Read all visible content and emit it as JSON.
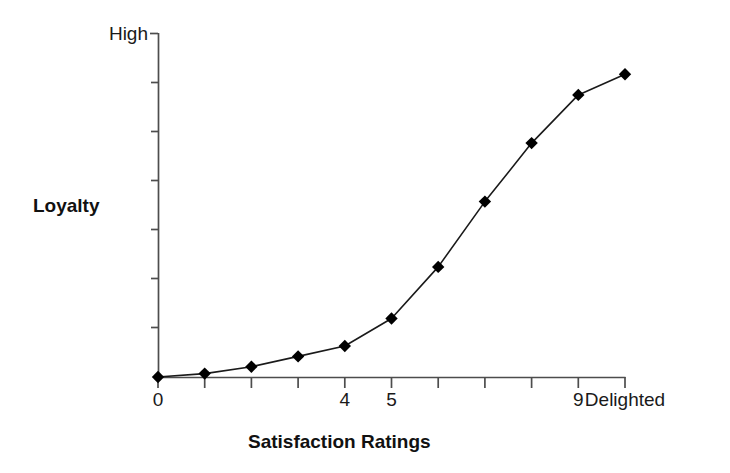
{
  "chart_data": {
    "type": "line",
    "title": "",
    "subtitle": "",
    "xlabel": "Satisfaction Ratings",
    "ylabel": "Loyalty",
    "x": [
      0,
      1,
      2,
      3,
      4,
      5,
      6,
      7,
      8,
      9,
      10
    ],
    "values": [
      0.0,
      0.01,
      0.03,
      0.06,
      0.09,
      0.17,
      0.32,
      0.51,
      0.68,
      0.82,
      0.88
    ],
    "series": [
      {
        "name": "Loyalty vs Satisfaction",
        "values": [
          0.0,
          0.01,
          0.03,
          0.06,
          0.09,
          0.17,
          0.32,
          0.51,
          0.68,
          0.82,
          0.88
        ]
      }
    ],
    "xlim": [
      0,
      10
    ],
    "ylim": [
      0,
      1
    ],
    "x_tick_positions": [
      0,
      1,
      2,
      3,
      4,
      5,
      6,
      7,
      8,
      9,
      10
    ],
    "x_tick_labels": [
      "0",
      "",
      "",
      "",
      "4",
      "5",
      "",
      "",
      "",
      "9",
      "Delighted"
    ],
    "y_tick_positions": [
      0,
      0.143,
      0.286,
      0.429,
      0.571,
      0.714,
      0.857,
      1.0
    ],
    "y_tick_labels": [
      "",
      "",
      "",
      "",
      "",
      "",
      "",
      "High"
    ],
    "y_axis_top_label": "High",
    "grid": false,
    "legend": false,
    "legend_position": "none",
    "marker": "diamond",
    "marker_color": "#000000",
    "line_color": "#1a1a1a",
    "line_width": 1.6,
    "axis_color": "#4d4d4d",
    "background_color": "#ffffff",
    "annotations": []
  },
  "axes": {
    "y_top_label": "High",
    "y_title": "Loyalty",
    "x_title": "Satisfaction Ratings"
  },
  "x_ticks": [
    {
      "value": 0,
      "label": "0"
    },
    {
      "value": 1,
      "label": ""
    },
    {
      "value": 2,
      "label": ""
    },
    {
      "value": 3,
      "label": ""
    },
    {
      "value": 4,
      "label": "4"
    },
    {
      "value": 5,
      "label": "5"
    },
    {
      "value": 6,
      "label": ""
    },
    {
      "value": 7,
      "label": ""
    },
    {
      "value": 8,
      "label": ""
    },
    {
      "value": 9,
      "label": "9"
    },
    {
      "value": 10,
      "label": "Delighted"
    }
  ]
}
